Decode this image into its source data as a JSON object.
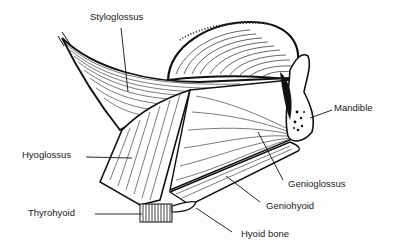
{
  "diagram": {
    "labels": [
      {
        "id": "styloglossus",
        "text": "Styloglossus",
        "x": 90,
        "y": 12
      },
      {
        "id": "mandible",
        "text": "Mandible",
        "x": 334,
        "y": 103
      },
      {
        "id": "hyoglossus",
        "text": "Hyoglossus",
        "x": 22,
        "y": 150
      },
      {
        "id": "genioglossus",
        "text": "Genioglossus",
        "x": 288,
        "y": 179
      },
      {
        "id": "geniohyoid",
        "text": "Geniohyoid",
        "x": 266,
        "y": 201
      },
      {
        "id": "thyrohyoid",
        "text": "Thyrohyoid",
        "x": 28,
        "y": 208
      },
      {
        "id": "hyoid_bone",
        "text": "Hyoid bone",
        "x": 241,
        "y": 229
      }
    ],
    "colors": {
      "ink": "#111111",
      "background": "#fdfdfd",
      "text": "#222222"
    }
  }
}
